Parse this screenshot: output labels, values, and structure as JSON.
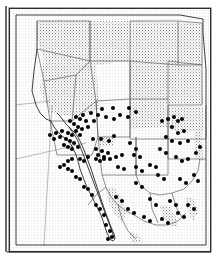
{
  "figure": {
    "kind": "distribution-map",
    "region": "Western North America",
    "caption": "",
    "frame_color": "#2b2b2b",
    "background_color": "#ffffff",
    "coastline_color": "#1a1a1a",
    "boundary_color": "#4a4a4a",
    "graticule_color": "#8a8a8a",
    "stipple_color": "#9a9a9a",
    "dot_color": "#000000",
    "dot_radius": 2.0
  },
  "legend": {
    "stipple_meaning": "shaded range",
    "dot_meaning": "locality record",
    "items": []
  },
  "map": {
    "width": 200,
    "height": 242,
    "outline": "M 25,6 L 170,6 L 193,10 L 193,24 L 196,60 L 196,118 L 196,178 L 196,236 L 150,236 L 96,236 L 40,236 L 6,236 L 6,150 L 6,70 L 6,6 Z",
    "coastline": "M 27,12 L 27,40 L 24,62 L 22,82 L 26,96 L 30,104 L 36,110 L 41,112 L 44,118 L 48,123 L 52,127 L 56,130 L 60,134 L 63,139 L 66,146 L 68,152 L 70,160 L 73,168 L 76,176 L 79,182 L 82,188 L 85,194 L 88,200 L 91,206 L 93,212 L 95,218 L 97,224 L 99,228 L 101,231 L 103,232 L 105,230 L 104,225 L 101,218 L 98,210 L 95,202 L 92,193 L 89,184 L 86,175 L 83,166 L 80,157 L 77,149 L 74,141 L 71,134 L 68,128 L 65,124 L 62,121 L 59,118 L 56,115 L 53,111 L 50,107 L 47,104",
    "gulf": "M 59,118 L 63,124 L 67,130 L 70,137 L 73,145 L 76,153 L 79,161 L 82,169 L 85,177 L 88,185 L 91,193 L 94,201 L 97,209 L 100,217 L 102,223 L 104,228",
    "graticule": [
      "M 6,150 L 76,134",
      "M 42,96 L 34,236",
      "M 6,96 L 40,92"
    ],
    "state_lines": [
      "M 27,12 L 80,12 L 80,52 L 27,40",
      "M 80,12 L 80,52 L 120,52 L 120,12",
      "M 27,40 L 34,72 L 66,66 L 80,52",
      "M 80,52 L 86,92 L 120,90 L 120,52",
      "M 34,72 L 40,112 L 62,112 L 66,66",
      "M 120,12 L 168,12 L 168,56 L 120,52",
      "M 168,12 L 192,14 L 192,56 L 168,56",
      "M 120,52 L 120,90 L 158,90 L 158,52",
      "M 158,52 L 192,56 L 192,96 L 158,96",
      "M 86,92 L 88,128 L 120,128 L 120,90",
      "M 120,90 L 120,130 L 158,130 L 158,90",
      "M 40,112 L 47,146 L 82,146 L 88,128 L 86,92 L 62,112",
      "M 88,128 L 92,166 L 126,166 L 126,128",
      "M 126,128 L 126,166 L 158,166 L 158,130",
      "M 158,96 L 158,130 L 196,130 L 196,96",
      "M 158,130 L 158,150 L 196,150",
      "M 126,166 L 130,176 L 140,184 L 150,186 L 162,184 L 174,180 L 182,172 L 188,162 L 190,150",
      "M 92,166 L 96,178 L 101,188 L 108,196 L 116,202 L 124,206",
      "M 124,206 L 134,212 L 146,216 L 158,216 L 168,212 L 176,204",
      "M 108,196 L 112,210 L 118,222 L 126,230",
      "M 140,184 L 142,200 L 148,214",
      "M 162,184 L 166,198 L 172,208",
      "M 96,178 L 86,186 L 78,196"
    ],
    "stipple_regions": [
      "M 28,12 L 118,12 L 120,52 L 86,56 L 34,50 L 27,30 Z",
      "M 120,12 L 190,14 L 192,56 L 158,56 L 120,52 Z",
      "M 34,50 L 86,56 L 90,100 L 66,108 L 40,104 L 30,80 Z",
      "M 120,52 L 158,54 L 158,94 L 120,92 Z",
      "M 158,54 L 192,58 L 193,96 L 158,94 Z",
      "M 120,92 L 156,92 L 157,118 L 120,120 Z",
      "M 157,96 L 193,98 L 193,122 L 170,124 L 157,118 Z",
      "M 88,128 L 104,126 L 104,136 L 90,138 Z",
      "M 184,120 L 192,122 L 193,152 L 186,150 Z",
      "M 96,180 L 104,178 L 112,190 L 116,204 L 112,214 L 104,204 L 98,192 Z",
      "M 150,196 L 160,198 L 166,208 L 168,220 L 160,216 L 152,206 Z",
      "M 176,188 L 184,190 L 188,202 L 184,212 L 178,204 Z",
      "M 118,222 L 128,226 L 134,234 L 122,234 Z"
    ],
    "dots": [
      [
        92,
        100
      ],
      [
        103,
        99
      ],
      [
        119,
        99
      ],
      [
        126,
        103
      ],
      [
        118,
        108
      ],
      [
        73,
        106
      ],
      [
        81,
        104
      ],
      [
        88,
        106
      ],
      [
        96,
        108
      ],
      [
        104,
        110
      ],
      [
        110,
        106
      ],
      [
        66,
        108
      ],
      [
        70,
        110
      ],
      [
        76,
        112
      ],
      [
        84,
        112
      ],
      [
        60,
        112
      ],
      [
        64,
        115
      ],
      [
        68,
        118
      ],
      [
        72,
        120
      ],
      [
        78,
        118
      ],
      [
        52,
        122
      ],
      [
        58,
        124
      ],
      [
        62,
        126
      ],
      [
        66,
        122
      ],
      [
        70,
        126
      ],
      [
        46,
        124
      ],
      [
        50,
        128
      ],
      [
        56,
        130
      ],
      [
        60,
        132
      ],
      [
        64,
        134
      ],
      [
        54,
        136
      ],
      [
        58,
        138
      ],
      [
        62,
        140
      ],
      [
        68,
        138
      ],
      [
        83,
        130
      ],
      [
        91,
        130
      ],
      [
        99,
        132
      ],
      [
        104,
        127
      ],
      [
        86,
        140
      ],
      [
        92,
        142
      ],
      [
        98,
        144
      ],
      [
        88,
        146
      ],
      [
        94,
        148
      ],
      [
        86,
        150
      ],
      [
        90,
        152
      ],
      [
        94,
        150
      ],
      [
        100,
        150
      ],
      [
        106,
        148
      ],
      [
        112,
        146
      ],
      [
        120,
        134
      ],
      [
        126,
        140
      ],
      [
        124,
        146
      ],
      [
        130,
        148
      ],
      [
        78,
        148
      ],
      [
        74,
        152
      ],
      [
        70,
        150
      ],
      [
        62,
        150
      ],
      [
        58,
        152
      ],
      [
        54,
        156
      ],
      [
        50,
        158
      ],
      [
        58,
        160
      ],
      [
        62,
        162
      ],
      [
        66,
        168
      ],
      [
        70,
        170
      ],
      [
        74,
        178
      ],
      [
        78,
        180
      ],
      [
        82,
        186
      ],
      [
        86,
        196
      ],
      [
        90,
        200
      ],
      [
        94,
        206
      ],
      [
        96,
        216
      ],
      [
        100,
        222
      ],
      [
        102,
        228
      ],
      [
        98,
        230
      ],
      [
        40,
        126
      ],
      [
        44,
        130
      ],
      [
        108,
        158
      ],
      [
        114,
        160
      ],
      [
        126,
        158
      ],
      [
        132,
        162
      ],
      [
        140,
        156
      ],
      [
        146,
        158
      ],
      [
        152,
        112
      ],
      [
        158,
        110
      ],
      [
        164,
        108
      ],
      [
        168,
        112
      ],
      [
        172,
        110
      ],
      [
        162,
        118
      ],
      [
        168,
        124
      ],
      [
        174,
        122
      ],
      [
        156,
        128
      ],
      [
        162,
        132
      ],
      [
        170,
        134
      ],
      [
        178,
        132
      ],
      [
        150,
        140
      ],
      [
        156,
        144
      ],
      [
        166,
        148
      ],
      [
        172,
        152
      ],
      [
        178,
        150
      ],
      [
        186,
        144
      ],
      [
        190,
        138
      ],
      [
        148,
        166
      ],
      [
        154,
        170
      ],
      [
        170,
        170
      ],
      [
        176,
        174
      ],
      [
        184,
        166
      ],
      [
        188,
        172
      ],
      [
        126,
        174
      ],
      [
        132,
        178
      ],
      [
        140,
        190
      ],
      [
        146,
        196
      ],
      [
        160,
        192
      ],
      [
        166,
        196
      ],
      [
        178,
        196
      ],
      [
        184,
        200
      ],
      [
        106,
        188
      ],
      [
        112,
        192
      ],
      [
        118,
        200
      ],
      [
        124,
        204
      ],
      [
        134,
        208
      ],
      [
        140,
        212
      ],
      [
        152,
        210
      ],
      [
        158,
        214
      ],
      [
        168,
        204
      ],
      [
        174,
        208
      ]
    ]
  }
}
